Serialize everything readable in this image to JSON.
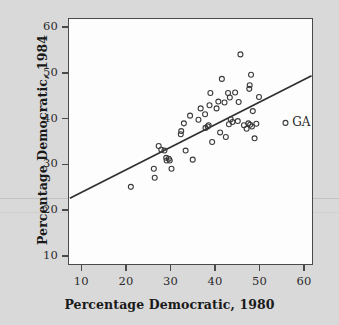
{
  "chart_data": {
    "type": "scatter",
    "title": "",
    "xlabel": "Percentage Democratic, 1980",
    "ylabel": "Percentage Democratic, 1984",
    "xlim": [
      7,
      62
    ],
    "ylim": [
      8,
      62
    ],
    "xticks": [
      10,
      20,
      30,
      40,
      50,
      60
    ],
    "yticks": [
      10,
      20,
      30,
      40,
      50,
      60
    ],
    "grid": false,
    "legend": null,
    "point_marker": "open-circle",
    "series": [
      {
        "name": "States",
        "points": [
          [
            21.0,
            25.0
          ],
          [
            26.2,
            29.0
          ],
          [
            26.4,
            27.0
          ],
          [
            27.3,
            34.0
          ],
          [
            27.9,
            33.2
          ],
          [
            28.6,
            33.0
          ],
          [
            29.0,
            31.4
          ],
          [
            29.1,
            30.8
          ],
          [
            29.6,
            31.2
          ],
          [
            29.8,
            30.8
          ],
          [
            30.2,
            29.0
          ],
          [
            32.3,
            36.6
          ],
          [
            32.4,
            37.3
          ],
          [
            33.0,
            39.0
          ],
          [
            33.4,
            33.0
          ],
          [
            34.4,
            40.7
          ],
          [
            35.0,
            31.0
          ],
          [
            36.3,
            39.8
          ],
          [
            36.8,
            42.3
          ],
          [
            37.8,
            41.0
          ],
          [
            37.9,
            38.0
          ],
          [
            38.4,
            38.3
          ],
          [
            38.6,
            38.6
          ],
          [
            38.8,
            43.0
          ],
          [
            39.0,
            45.7
          ],
          [
            39.4,
            34.9
          ],
          [
            40.4,
            42.3
          ],
          [
            40.8,
            43.8
          ],
          [
            41.2,
            37.0
          ],
          [
            41.6,
            48.8
          ],
          [
            42.2,
            43.6
          ],
          [
            42.5,
            36.0
          ],
          [
            43.0,
            45.7
          ],
          [
            43.2,
            38.8
          ],
          [
            43.4,
            44.7
          ],
          [
            43.6,
            39.9
          ],
          [
            44.0,
            39.3
          ],
          [
            44.6,
            45.8
          ],
          [
            45.2,
            39.5
          ],
          [
            45.4,
            43.7
          ],
          [
            45.8,
            54.2
          ],
          [
            46.6,
            38.6
          ],
          [
            47.2,
            37.8
          ],
          [
            47.6,
            39.0
          ],
          [
            47.8,
            46.6
          ],
          [
            47.9,
            47.4
          ],
          [
            48.0,
            38.7
          ],
          [
            48.2,
            49.7
          ],
          [
            48.4,
            38.3
          ],
          [
            48.6,
            41.7
          ],
          [
            49.0,
            35.7
          ],
          [
            49.4,
            38.9
          ],
          [
            50.0,
            44.8
          ],
          [
            56.0,
            39.1
          ]
        ]
      }
    ],
    "regression_line": {
      "x_start": 7.2,
      "y_start": 22.5,
      "x_end": 61.9,
      "y_end": 49.5
    },
    "annotations": [
      {
        "label": "GA",
        "x": 56.0,
        "y": 39.1
      }
    ],
    "colors": {
      "marker": "#3a3a3a",
      "line": "#2f2f2f",
      "axis": "#4a4a4a",
      "plot_background": "#fdfdfd",
      "page_background": "#d9d9d9"
    }
  }
}
